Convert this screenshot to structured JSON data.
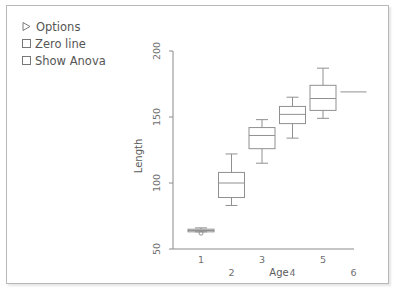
{
  "panel": {
    "background": "#ffffff",
    "border_color": "#b8b8b8"
  },
  "controls": {
    "items": [
      {
        "icon": "triangle-right-icon",
        "label": "Options",
        "type": "disclosure",
        "checked": false
      },
      {
        "icon": "checkbox-icon",
        "label": "Zero line",
        "type": "checkbox",
        "checked": false
      },
      {
        "icon": "checkbox-icon",
        "label": "Show Anova",
        "type": "checkbox",
        "checked": false
      }
    ]
  },
  "chart_data": {
    "type": "box",
    "title": "",
    "xlabel": "Age",
    "ylabel": "Length",
    "categories": [
      "1",
      "2",
      "3",
      "4",
      "5",
      "6"
    ],
    "ylim": [
      50,
      200
    ],
    "yticks": [
      50,
      100,
      150,
      200
    ],
    "xticks": [
      1,
      2,
      3,
      4,
      5,
      6
    ],
    "grid": false,
    "legend": "none",
    "line_color": "#909090",
    "axis_color": "#8a8a8a",
    "boxes": [
      {
        "category": "1",
        "whisker_low": 63,
        "q1": 63,
        "median": 64,
        "q3": 65,
        "whisker_high": 66,
        "outliers": [
          62
        ]
      },
      {
        "category": "2",
        "whisker_low": 83,
        "q1": 89,
        "median": 100,
        "q3": 108,
        "whisker_high": 122,
        "outliers": []
      },
      {
        "category": "3",
        "whisker_low": 115,
        "q1": 126,
        "median": 136,
        "q3": 142,
        "whisker_high": 148,
        "outliers": []
      },
      {
        "category": "4",
        "whisker_low": 134,
        "q1": 145,
        "median": 152,
        "q3": 158,
        "whisker_high": 165,
        "outliers": []
      },
      {
        "category": "5",
        "whisker_low": 149,
        "q1": 155,
        "median": 164,
        "q3": 174,
        "whisker_high": 187,
        "outliers": []
      },
      {
        "category": "6",
        "whisker_low": 169,
        "q1": 169,
        "median": 169,
        "q3": 169,
        "whisker_high": 169,
        "outliers": []
      }
    ]
  },
  "axes": {
    "y_tick_labels": [
      "50",
      "100",
      "150",
      "200"
    ],
    "x_tick_labels": [
      "1",
      "2",
      "3",
      "4",
      "5",
      "6"
    ],
    "y_axis_title": "Length",
    "x_axis_title": "Age"
  }
}
